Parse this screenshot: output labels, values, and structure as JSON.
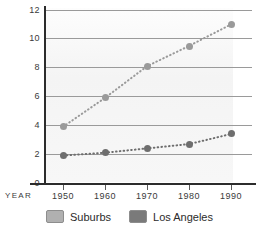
{
  "chart_data": {
    "type": "line",
    "title": "",
    "xlabel": "YEAR",
    "ylabel": "",
    "categories": [
      "1950",
      "1960",
      "1970",
      "1980",
      "1990"
    ],
    "x": [
      1950,
      1960,
      1970,
      1980,
      1990
    ],
    "xlim": [
      1945,
      1995
    ],
    "ylim": [
      0,
      12
    ],
    "yticks": [
      0,
      2,
      4,
      6,
      8,
      10,
      12
    ],
    "ytick_labels": [
      "0",
      "2",
      "4",
      "6",
      "8",
      "10",
      "12"
    ],
    "grid": true,
    "legend_position": "bottom",
    "line_style": "dotted",
    "marker": "circle",
    "series": [
      {
        "name": "Suburbs",
        "color": "#9a9a9a",
        "values": [
          3.9,
          5.9,
          8.1,
          9.5,
          11.0
        ]
      },
      {
        "name": "Los Angeles",
        "color": "#6e6e6e",
        "values": [
          1.9,
          2.1,
          2.4,
          2.7,
          3.4
        ]
      }
    ]
  },
  "axes": {
    "year_label": "YEAR",
    "y_tick_labels": [
      "12",
      "10",
      "8",
      "6",
      "4",
      "2",
      "0"
    ],
    "x_tick_labels": [
      "1950",
      "1960",
      "1970",
      "1980",
      "1990"
    ]
  },
  "legend": {
    "items": [
      {
        "label": "Suburbs",
        "color": "#b0b0b0"
      },
      {
        "label": "Los Angeles",
        "color": "#7a7a7a"
      }
    ]
  },
  "colors": {
    "axis": "#2c2c2c",
    "grid": "#9a9a9a",
    "suburbs": "#9a9a9a",
    "los_angeles": "#6e6e6e",
    "plot_background": "#f5f5f5"
  }
}
